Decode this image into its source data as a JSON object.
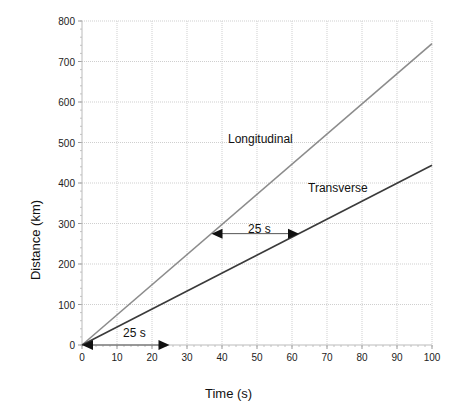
{
  "chart_data": {
    "type": "line",
    "title": "",
    "xlabel": "Time (s)",
    "ylabel": "Distance (km)",
    "xlim": [
      0,
      100
    ],
    "ylim": [
      0,
      800
    ],
    "xticks": [
      0,
      10,
      20,
      30,
      40,
      50,
      60,
      70,
      80,
      90,
      100
    ],
    "yticks": [
      0,
      100,
      200,
      300,
      400,
      500,
      600,
      700,
      800
    ],
    "grid": true,
    "legend": "none (inline labels)",
    "series": [
      {
        "name": "Longitudinal",
        "color": "#8c8c8c",
        "x": [
          0,
          100
        ],
        "y": [
          0,
          744
        ]
      },
      {
        "name": "Transverse",
        "color": "#3a3a3a",
        "x": [
          0,
          100
        ],
        "y": [
          0,
          444
        ]
      }
    ],
    "annotations": [
      {
        "text": "Longitudinal",
        "x": 55,
        "y": 500
      },
      {
        "text": "Transverse",
        "x": 72,
        "y": 380
      },
      {
        "text": "25 s",
        "type": "double-arrow",
        "x_start": 37,
        "x_end": 62,
        "y": 275
      },
      {
        "text": "25 s",
        "type": "double-arrow",
        "x_start": 0,
        "x_end": 25,
        "y": 0
      }
    ]
  },
  "labels": {
    "xlabel": "Time (s)",
    "ylabel": "Distance (km)",
    "longitudinal": "Longitudinal",
    "transverse": "Transverse",
    "gap_upper": "25 s",
    "gap_lower": "25 s"
  }
}
